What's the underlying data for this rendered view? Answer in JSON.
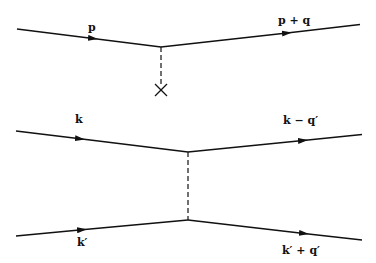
{
  "diagram": {
    "type": "feynman",
    "top": {
      "incoming_label": "p",
      "outgoing_label": "p + q",
      "propagator": "dashed",
      "source_marker": "×"
    },
    "bottom": {
      "upper_incoming_label": "k",
      "upper_outgoing_label": "k − q′",
      "lower_incoming_label": "k′",
      "lower_outgoing_label": "k′ + q′",
      "propagator": "dashed"
    }
  }
}
